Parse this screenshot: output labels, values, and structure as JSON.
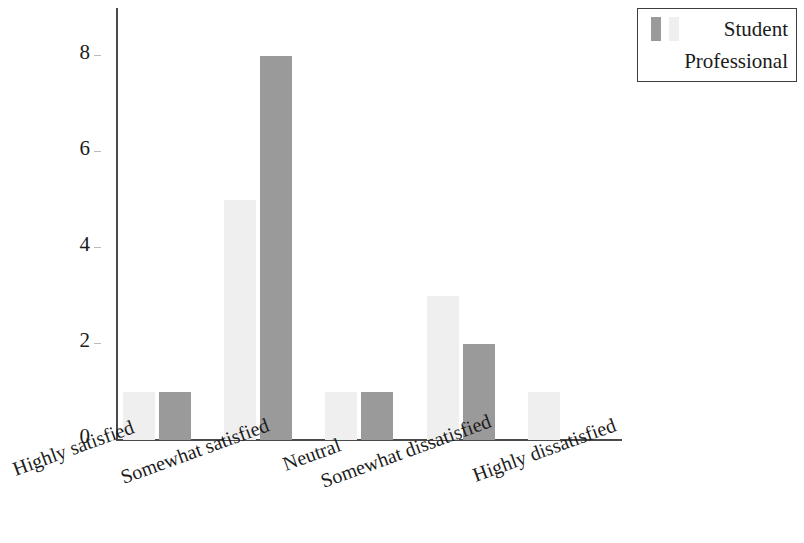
{
  "chart_data": {
    "type": "bar",
    "title": "",
    "subtitle": "",
    "xlabel": "",
    "ylabel": "",
    "categories": [
      "Highly satisfied",
      "Somewhat satisfied",
      "Neutral",
      "Somewhat dissatisfied",
      "Highly dissatisfied"
    ],
    "series": [
      {
        "name": "Professional",
        "color": "#efefef",
        "values": [
          1,
          5,
          1,
          3,
          1
        ]
      },
      {
        "name": "Student",
        "color": "#9a9a9a",
        "values": [
          1,
          8,
          1,
          2,
          0
        ]
      }
    ],
    "ylim": [
      0,
      9
    ],
    "yticks": [
      0,
      2,
      4,
      6,
      8
    ],
    "ytick_labels": [
      "0",
      "2",
      "4",
      "6",
      "8"
    ],
    "grid": false,
    "legend_position": "top-right",
    "legend_entries": [
      "Student",
      "Professional"
    ],
    "xtick_rotation": -20
  },
  "legend": {
    "student_label": "Student",
    "professional_label": "Professional"
  },
  "axis": {
    "y_ticks": [
      "0",
      "2",
      "4",
      "6",
      "8"
    ],
    "x_labels": [
      "Highly satisfied",
      "Somewhat satisfied",
      "Neutral",
      "Somewhat dissatisfied",
      "Highly dissatisfied"
    ]
  }
}
